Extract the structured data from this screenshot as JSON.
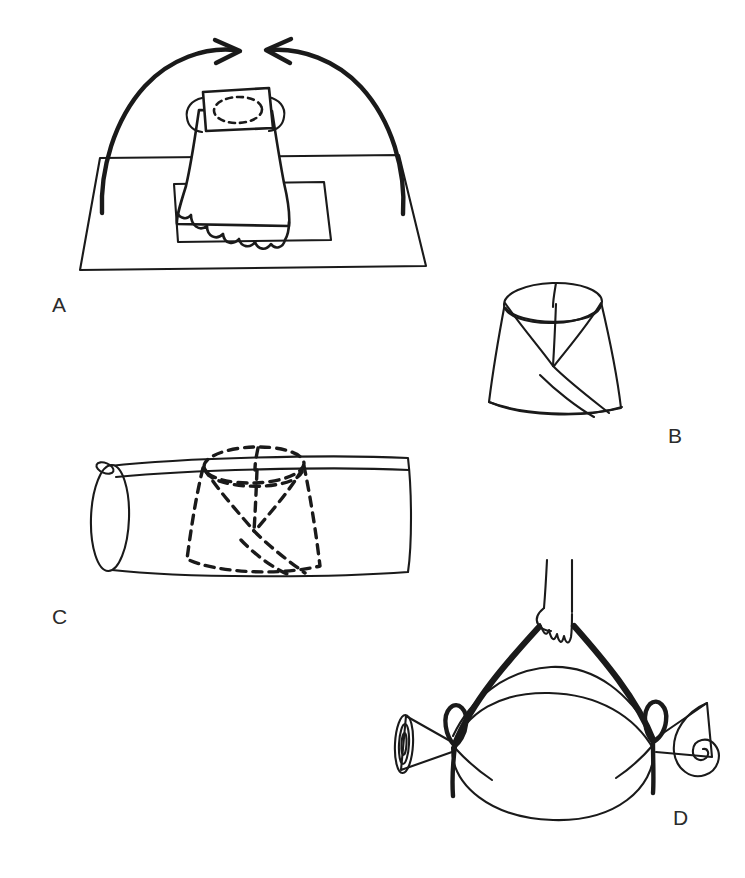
{
  "figure": {
    "background_color": "#ffffff",
    "ink_color": "#1a1a1a",
    "label_color": "#2b2b2b",
    "width": 745,
    "height": 878,
    "style": "hand-drawn black-and-white line illustration",
    "panel_count": 4
  },
  "panels": [
    {
      "id": "A",
      "label": "A",
      "label_x": 52,
      "label_y": 312,
      "caption": "Cloth draped over cone-shaped object on a square mat, with two curved arrows indicating the cloth corners being drawn upward and inward toward the top",
      "elements": [
        "outer-mat-quadrilateral",
        "inner-square",
        "draped-cone-cloth",
        "top-patch-rectangle",
        "dashed-ellipse-on-patch",
        "left-curved-arrow",
        "right-curved-arrow",
        "scalloped-cloth-hem"
      ]
    },
    {
      "id": "B",
      "label": "B",
      "label_x": 668,
      "label_y": 443,
      "caption": "Completed conical wrap shown as a truncated cone (frustum) with fold lines converging at the center and a diagonal seam running to the lower right",
      "elements": [
        "frustum-body",
        "top-ellipse-rim",
        "v-fold-lines",
        "diagonal-seam",
        "vertical-center-fold"
      ]
    },
    {
      "id": "C",
      "label": "C",
      "label_x": 52,
      "label_y": 624,
      "caption": "Horizontal cylinder (limb or roll) with the conical wrap shown as hidden dashed outline positioned over its middle",
      "elements": [
        "cylinder-body",
        "cylinder-left-end-ellipse",
        "cylinder-top-seam-line",
        "small-loop-at-left-top",
        "dashed-frustum-overlay",
        "dashed-fold-lines"
      ]
    },
    {
      "id": "D",
      "label": "D",
      "label_x": 673,
      "label_y": 825,
      "caption": "Hand gripping the apex of a sling formed by two heavy straps tied at knots on each side, with the fabric ends rolled into spirals at left and right",
      "elements": [
        "hand-with-fingers",
        "forearm-lines",
        "left-heavy-strap",
        "right-heavy-strap",
        "upper-fabric-curve",
        "lower-fabric-curve",
        "bottom-pouch-curve",
        "left-knot-bow",
        "right-knot-bow",
        "left-rolled-spiral-end",
        "right-rolled-spiral-end"
      ]
    }
  ],
  "labels": {
    "a": "A",
    "b": "B",
    "c": "C",
    "d": "D"
  }
}
